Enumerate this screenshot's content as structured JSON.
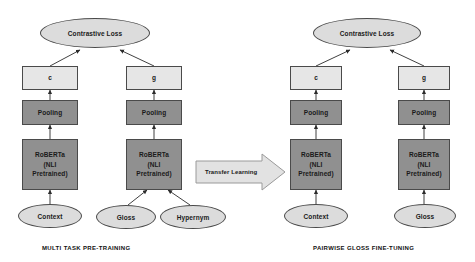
{
  "figure": {
    "type": "diagram",
    "title": "",
    "panels": [
      {
        "id": "multi-task-pretraining",
        "label": "MULTI TASK  PRE-TRAINING",
        "nodes": {
          "loss": "Contrastive Loss",
          "embed_c": "c",
          "embed_g": "g",
          "pooling_left": "Pooling",
          "pooling_right": "Pooling",
          "encoder_left": "RoBERTa\n(NLI\nPretrained)",
          "encoder_left_line1": "RoBERTa",
          "encoder_left_line2": "(NLI",
          "encoder_left_line3": "Pretrained)",
          "encoder_right_line1": "RoBERTa",
          "encoder_right_line2": "(NLI",
          "encoder_right_line3": "Pretrained)",
          "input_context": "Context",
          "input_gloss": "Gloss",
          "input_hypernym": "Hypernym"
        }
      },
      {
        "id": "pairwise-gloss-finetuning",
        "label": "PAIRWISE GLOSS  FINE-TUNING",
        "nodes": {
          "loss": "Contrastive Loss",
          "embed_c": "c",
          "embed_g": "g",
          "pooling_left": "Pooling",
          "pooling_right": "Pooling",
          "encoder_left_line1": "RoBERTa",
          "encoder_left_line2": "(NLI",
          "encoder_left_line3": "Pretrained)",
          "encoder_right_line1": "RoBERTa",
          "encoder_right_line2": "(NLI",
          "encoder_right_line3": "Pretrained)",
          "input_context": "Context",
          "input_gloss": "Gloss"
        }
      }
    ],
    "transfer_arrow": {
      "label": "Transfer Learning"
    },
    "colors": {
      "box_light": "#e6e6e6",
      "box_dark": "#909090",
      "ellipse": "#dcdcdc",
      "stroke": "#4a4a4a",
      "text": "#1a1a1a",
      "background": "#ffffff"
    }
  }
}
